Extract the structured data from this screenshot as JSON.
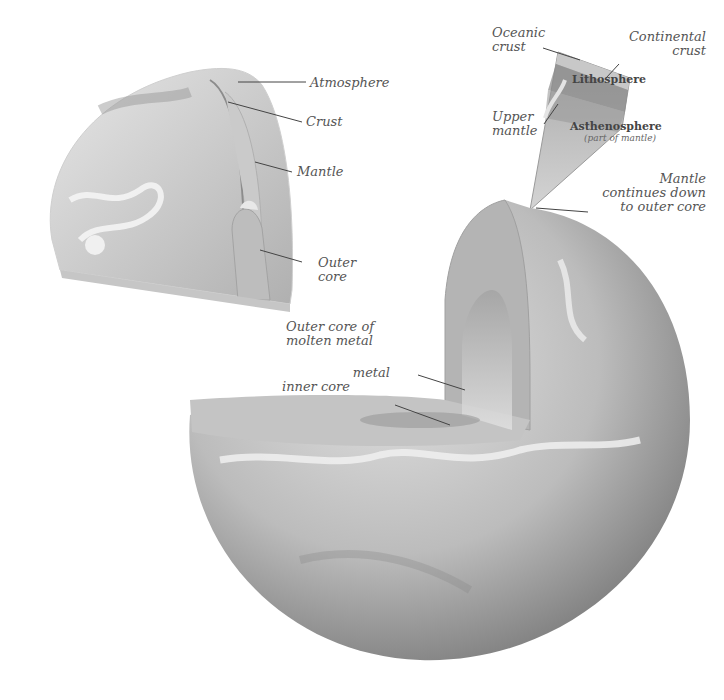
{
  "diagram": {
    "colors": {
      "background": "#ffffff",
      "label_text": "#555555",
      "leader_line": "#444444",
      "globe_light": "#d8d8d8",
      "globe_dark": "#8a8a8a",
      "cut_face": "#bdbdbd",
      "core": "#9e9e9e"
    },
    "small_cutaway": {
      "labels": {
        "atmosphere": "Atmosphere",
        "crust": "Crust",
        "mantle": "Mantle",
        "outer_core_line1": "Outer",
        "outer_core_line2": "core"
      }
    },
    "wedge_detail": {
      "labels": {
        "oceanic_crust_line1": "Oceanic",
        "oceanic_crust_line2": "crust",
        "continental_crust_line1": "Continental",
        "continental_crust_line2": "crust",
        "lithosphere": "Lithosphere",
        "upper_mantle_line1": "Upper",
        "upper_mantle_line2": "mantle",
        "asthenosphere": "Asthenosphere",
        "asthenosphere_note": "(part of mantle)",
        "mantle_continues_line1": "Mantle",
        "mantle_continues_line2": "continues down",
        "mantle_continues_line3": "to outer core"
      }
    },
    "large_cutaway": {
      "labels": {
        "outer_core_molten_line1": "Outer core of",
        "outer_core_molten_line2": "molten metal",
        "inner_core_line1": "metal",
        "inner_core_line2": "inner core"
      }
    }
  }
}
